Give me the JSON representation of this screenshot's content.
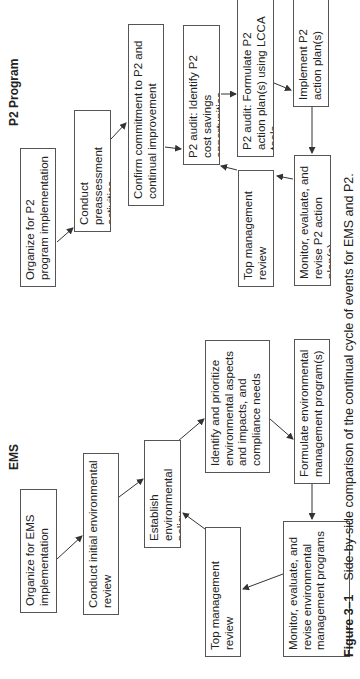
{
  "ems": {
    "title": "EMS",
    "boxes": {
      "organize": "Organize for EMS implementation",
      "conduct_review": "Conduct initial environmental review",
      "establish_policy": "Establish environmental policy",
      "identify_aspects": "Identify and prioritize environmental aspects and impacts, and compliance needs",
      "formulate_programs": "Formulate environmental management program(s)",
      "monitor": "Monitor, evaluate, and revise environmental management programs",
      "top_review": "Top management review"
    }
  },
  "p2": {
    "title": "P2 Program",
    "boxes": {
      "organize": "Organize for P2 program implementation",
      "preassessment": "Conduct preassessment activities",
      "confirm": "Confirm commitment to P2 and continual improvement",
      "audit_identify": "P2 audit: Identify P2 cost savings opportunities",
      "audit_formulate": "P2 audit: Formulate P2 action plan(s) using LCCA tools",
      "implement": "Implement P2 action plan(s)",
      "monitor": "Monitor, evaluate, and revise P2 action plan(s)",
      "top_review": "Top management review"
    }
  },
  "caption": {
    "label": "Figure 3–1",
    "text": "Side-by-side comparison of the continual cycle of events for EMS and P2."
  },
  "colors": {
    "border": "#555555",
    "arrow": "#333333",
    "text": "#222222"
  }
}
